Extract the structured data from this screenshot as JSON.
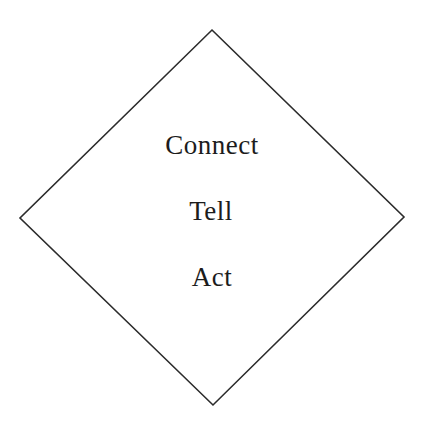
{
  "diagram": {
    "shape": "diamond-outline",
    "stroke_color": "#2b2b2b",
    "background_color": "#ffffff",
    "text_color": "#1c1c1c",
    "labels": {
      "first": "Connect",
      "second": "Tell",
      "third": "Act"
    }
  }
}
